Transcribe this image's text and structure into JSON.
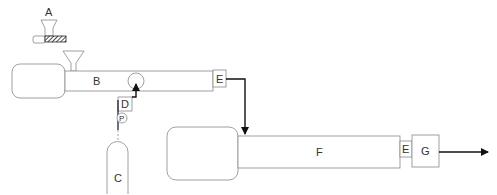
{
  "diagram": {
    "labels": {
      "feeder": "A",
      "extruder1": "B",
      "cylinder": "C",
      "valve": "D",
      "die1": "E",
      "extruder2": "F",
      "die2": "E",
      "output": "G",
      "pump": "P"
    },
    "colors": {
      "line": "#888888",
      "arrow": "#111111",
      "text": "#333333"
    }
  }
}
